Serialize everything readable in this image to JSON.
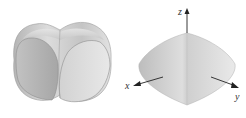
{
  "figures": [
    {
      "id": "left",
      "description": "Intersection of two cylinders (bicylinder) shaded surface",
      "colors": {
        "fill_light": "#e4e4e4",
        "fill_mid": "#c8c8c8",
        "fill_dark": "#a9a9a9",
        "edge": "#8a8a8a"
      }
    },
    {
      "id": "right",
      "description": "Solid of intersection with coordinate axes",
      "axes": {
        "x": "x",
        "y": "y",
        "z": "z"
      },
      "colors": {
        "fill_light": "#ececec",
        "fill_mid": "#cfcfcf",
        "fill_dark": "#b0b0b0",
        "axis": "#222222"
      }
    }
  ]
}
